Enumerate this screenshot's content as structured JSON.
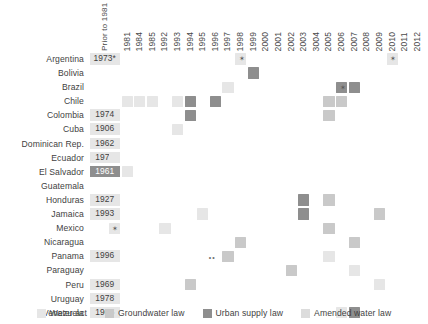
{
  "chart_data": {
    "type": "heatmap",
    "title": "",
    "xlabel": "",
    "ylabel": "",
    "grid": false,
    "legend_position": "bottom",
    "prior_column_label": "Prior to 1981",
    "columns": [
      "1981",
      "1984",
      "1985",
      "1992",
      "1993",
      "1994",
      "1995",
      "1996",
      "1997",
      "1998",
      "1999",
      "2000",
      "2001",
      "2002",
      "2003",
      "3004",
      "2005",
      "2006",
      "2007",
      "2008",
      "2009",
      "2010",
      "2011",
      "2012"
    ],
    "categories": [
      "Argentina",
      "Bolivia",
      "Brazil",
      "Chile",
      "Colombia",
      "Cuba",
      "Dominican Rep.",
      "Ecuador",
      "El Salvador",
      "Guatemala",
      "Honduras",
      "Jamaica",
      "Mexico",
      "Nicaragua",
      "Panama",
      "Paraguay",
      "Peru",
      "Uruguay",
      "Venezuela"
    ],
    "legend": [
      {
        "key": "water_act",
        "label": "Water act",
        "color": "#e6e6e6"
      },
      {
        "key": "groundwater_law",
        "label": "Groundwater law",
        "color": "#c9c9c9"
      },
      {
        "key": "urban_supply_law",
        "label": "Urban supply law",
        "color": "#8e8e8e"
      },
      {
        "key": "amended_water_law",
        "label": "Amended water law",
        "color": "#dcdcdc"
      }
    ],
    "rows": [
      {
        "country": "Argentina",
        "prior": {
          "value": "1973*",
          "type": "water_act"
        },
        "cells": [
          {
            "year": "1998",
            "type": "water_act",
            "marker": "star"
          },
          {
            "year": "2010",
            "type": "water_act",
            "marker": "star"
          }
        ]
      },
      {
        "country": "Bolivia",
        "prior": {
          "value": "",
          "type": "none"
        },
        "cells": [
          {
            "year": "1999",
            "type": "urban_supply_law",
            "marker": "none"
          }
        ]
      },
      {
        "country": "Brazil",
        "prior": {
          "value": "",
          "type": "none"
        },
        "cells": [
          {
            "year": "1997",
            "type": "water_act",
            "marker": "none"
          },
          {
            "year": "2006",
            "type": "urban_supply_law",
            "marker": "star"
          },
          {
            "year": "2007",
            "type": "urban_supply_law",
            "marker": "none"
          }
        ]
      },
      {
        "country": "Chile",
        "prior": {
          "value": "",
          "type": "none"
        },
        "cells": [
          {
            "year": "1981",
            "type": "water_act",
            "marker": "none"
          },
          {
            "year": "1984",
            "type": "water_act",
            "marker": "none"
          },
          {
            "year": "1985",
            "type": "water_act",
            "marker": "none"
          },
          {
            "year": "1993",
            "type": "water_act",
            "marker": "none"
          },
          {
            "year": "1994",
            "type": "urban_supply_law",
            "marker": "none"
          },
          {
            "year": "1996",
            "type": "urban_supply_law",
            "marker": "none"
          },
          {
            "year": "2005",
            "type": "groundwater_law",
            "marker": "none"
          },
          {
            "year": "2006",
            "type": "groundwater_law",
            "marker": "none"
          }
        ]
      },
      {
        "country": "Colombia",
        "prior": {
          "value": "1974",
          "type": "water_act"
        },
        "cells": [
          {
            "year": "1994",
            "type": "urban_supply_law",
            "marker": "none"
          },
          {
            "year": "2005",
            "type": "groundwater_law",
            "marker": "none"
          }
        ]
      },
      {
        "country": "Cuba",
        "prior": {
          "value": "1906",
          "type": "water_act"
        },
        "cells": [
          {
            "year": "1993",
            "type": "water_act",
            "marker": "none"
          }
        ]
      },
      {
        "country": "Dominican Rep.",
        "prior": {
          "value": "1962",
          "type": "water_act"
        },
        "cells": []
      },
      {
        "country": "Ecuador",
        "prior": {
          "value": "1972",
          "type": "water_act"
        },
        "cells": [
          {
            "year": "2004",
            "type": "water_act",
            "marker": "none"
          }
        ]
      },
      {
        "country": "El Salvador",
        "prior": {
          "value": "1961",
          "type": "urban_supply_law"
        },
        "cells": [
          {
            "year": "1981",
            "type": "water_act",
            "marker": "none"
          }
        ]
      },
      {
        "country": "Guatemala",
        "prior": {
          "value": "",
          "type": "none"
        },
        "cells": []
      },
      {
        "country": "Honduras",
        "prior": {
          "value": "1927",
          "type": "water_act"
        },
        "cells": [
          {
            "year": "2003",
            "type": "urban_supply_law",
            "marker": "none"
          },
          {
            "year": "2005",
            "type": "groundwater_law",
            "marker": "none"
          }
        ]
      },
      {
        "country": "Jamaica",
        "prior": {
          "value": "1993",
          "type": "water_act"
        },
        "cells": [
          {
            "year": "1995",
            "type": "water_act",
            "marker": "none"
          },
          {
            "year": "2003",
            "type": "urban_supply_law",
            "marker": "none"
          },
          {
            "year": "2009",
            "type": "groundwater_law",
            "marker": "none"
          }
        ]
      },
      {
        "country": "Mexico",
        "prior": {
          "value": "",
          "type": "none"
        },
        "cells": [
          {
            "year": "1992",
            "type": "water_act",
            "marker": "none"
          },
          {
            "year": "2004",
            "type": "water_act",
            "marker": "star"
          },
          {
            "year": "2005",
            "type": "groundwater_law",
            "marker": "none"
          }
        ]
      },
      {
        "country": "Nicaragua",
        "prior": {
          "value": "",
          "type": "none"
        },
        "cells": [
          {
            "year": "1998",
            "type": "groundwater_law",
            "marker": "none"
          },
          {
            "year": "2007",
            "type": "groundwater_law",
            "marker": "none"
          }
        ]
      },
      {
        "country": "Panama",
        "prior": {
          "value": "1996",
          "type": "water_act"
        },
        "cells": [
          {
            "year": "1996",
            "type": "none",
            "marker": "dots"
          },
          {
            "year": "1997",
            "type": "groundwater_law",
            "marker": "none"
          },
          {
            "year": "2005",
            "type": "water_act",
            "marker": "none"
          }
        ]
      },
      {
        "country": "Paraguay",
        "prior": {
          "value": "",
          "type": "none"
        },
        "cells": [
          {
            "year": "2002",
            "type": "groundwater_law",
            "marker": "none"
          },
          {
            "year": "2007",
            "type": "water_act",
            "marker": "none"
          }
        ]
      },
      {
        "country": "Peru",
        "prior": {
          "value": "1969",
          "type": "water_act"
        },
        "cells": [
          {
            "year": "1994",
            "type": "groundwater_law",
            "marker": "none"
          },
          {
            "year": "2009",
            "type": "water_act",
            "marker": "none"
          }
        ]
      },
      {
        "country": "Uruguay",
        "prior": {
          "value": "1978",
          "type": "water_act"
        },
        "cells": []
      },
      {
        "country": "Venezuela",
        "prior": {
          "value": "1965",
          "type": "water_act"
        },
        "cells": [
          {
            "year": "2006",
            "type": "water_act",
            "marker": "none"
          },
          {
            "year": "2007",
            "type": "urban_supply_law",
            "marker": "none"
          }
        ]
      }
    ]
  }
}
